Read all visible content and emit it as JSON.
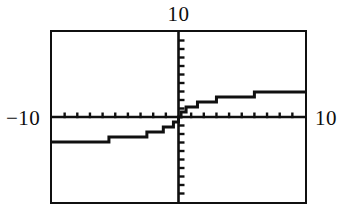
{
  "graph": {
    "labels": {
      "ymax": "10",
      "xmin": "−10",
      "xmax": "10"
    },
    "colors": {
      "ink": "#101010",
      "background": "#ffffff"
    }
  },
  "chart_data": {
    "type": "line",
    "title": "",
    "xlabel": "",
    "ylabel": "",
    "xlim": [
      -10,
      10
    ],
    "ylim": [
      -10,
      10
    ],
    "grid": false,
    "legend": false,
    "axes": {
      "x_axis_y_value": 0,
      "y_axis_x_value": 0,
      "x_tick_step": 1,
      "y_tick_step": 1,
      "x_ticks": [
        -9,
        -8,
        -7,
        -6,
        -5,
        -4,
        -3,
        -2,
        -1,
        1,
        2,
        3,
        4,
        5,
        6,
        7,
        8,
        9
      ],
      "y_ticks": [
        -9,
        -8,
        -7,
        -6,
        -5,
        -4,
        -3,
        -2,
        -1,
        1,
        2,
        3,
        4,
        5,
        6,
        7,
        8,
        9
      ]
    },
    "series": [
      {
        "name": "arctan-like curve",
        "render": "stair-step",
        "x": [
          -10.0,
          -9.5,
          -9.0,
          -8.5,
          -8.0,
          -7.5,
          -7.0,
          -6.5,
          -6.0,
          -5.5,
          -5.0,
          -4.5,
          -4.0,
          -3.5,
          -3.0,
          -2.5,
          -2.0,
          -1.5,
          -1.2,
          -1.0,
          -0.8,
          -0.6,
          -0.4,
          -0.2,
          0.0,
          0.2,
          0.4,
          0.6,
          0.8,
          1.0,
          1.2,
          1.5,
          2.0,
          2.5,
          3.0,
          3.5,
          4.0,
          4.5,
          5.0,
          5.5,
          6.0,
          6.5,
          7.0,
          7.5,
          8.0,
          8.5,
          9.0,
          9.5,
          10.0
        ],
        "y": [
          -2.94,
          -2.92,
          -2.89,
          -2.86,
          -2.83,
          -2.79,
          -2.75,
          -2.71,
          -2.66,
          -2.6,
          -2.53,
          -2.46,
          -2.37,
          -2.27,
          -2.15,
          -2.0,
          -1.82,
          -1.57,
          -1.4,
          -1.29,
          -1.16,
          -1.0,
          -0.79,
          -0.51,
          0.0,
          0.51,
          0.79,
          1.0,
          1.16,
          1.29,
          1.4,
          1.57,
          1.82,
          2.0,
          2.15,
          2.27,
          2.37,
          2.46,
          2.53,
          2.6,
          2.66,
          2.71,
          2.75,
          2.79,
          2.83,
          2.86,
          2.89,
          2.92,
          2.94
        ]
      }
    ],
    "annotations": [
      {
        "text": "10",
        "position": "top-center",
        "meaning": "y-axis maximum"
      },
      {
        "text": "−10",
        "position": "left-middle",
        "meaning": "x-axis minimum"
      },
      {
        "text": "10",
        "position": "right-middle",
        "meaning": "x-axis maximum"
      }
    ]
  }
}
